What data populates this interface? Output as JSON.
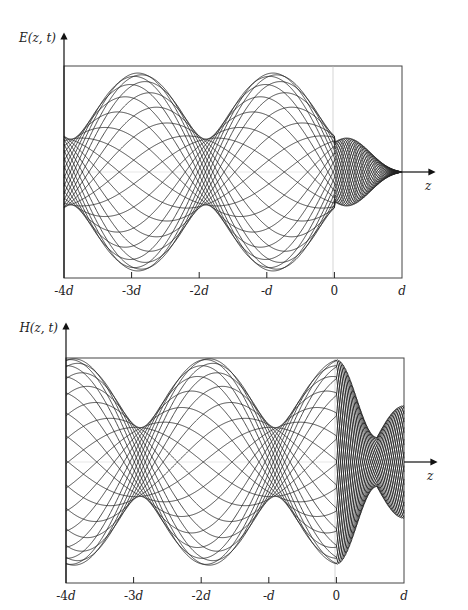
{
  "figure": {
    "panels": [
      {
        "id": "E",
        "ylabel": "E(z, t)",
        "xlabel": "z",
        "ticks": [
          "-4d",
          "-3d",
          "-2d",
          "-d",
          "0",
          "d"
        ]
      },
      {
        "id": "H",
        "ylabel": "H(z, t)",
        "xlabel": "z",
        "ticks": [
          "-4d",
          "-3d",
          "-2d",
          "-d",
          "0",
          "d"
        ]
      }
    ]
  },
  "chart_data": [
    {
      "type": "line",
      "title": "",
      "ylabel": "E(z, t)",
      "xlabel": "z",
      "x_ticks": [
        "-4d",
        "-3d",
        "-2d",
        "-d",
        "0",
        "d"
      ],
      "x_range": [
        "-4d",
        "d"
      ],
      "grid": false,
      "legend": null,
      "description": "Family of snapshots of E(z,t) for many instants t; envelope forms a partial standing wave for z<0 (max/min ratio ~3) with maxima near -3d and -d, minima near -4d, -2d and just left of 0; region 0<z<d shows a short-wavelength small-amplitude bulge converging to zero at z=d.",
      "envelope_region1": {
        "max_at": [
          "-3d",
          "-d"
        ],
        "min_at": [
          "-4d",
          "-2d",
          "~-0.1d"
        ],
        "max_over_min": 3
      },
      "envelope_region2": {
        "value_at_0": 0.45,
        "bulge_at": "0.6d",
        "value_at_d": 0
      }
    },
    {
      "type": "line",
      "title": "",
      "ylabel": "H(z, t)",
      "xlabel": "z",
      "x_ticks": [
        "-4d",
        "-3d",
        "-2d",
        "-d",
        "0",
        "d"
      ],
      "x_range": [
        "-4d",
        "d"
      ],
      "grid": false,
      "legend": null,
      "description": "Family of snapshots of H(z,t); envelope is partial standing wave for z<0 with maxima near -4d, -2d and 0 and minima near -3d and -d; region 0<z<d shows short-wavelength pattern with minimum near 0.6d and rising toward z=d.",
      "envelope_region1": {
        "max_at": [
          "-4d",
          "-2d",
          "0"
        ],
        "min_at": [
          "-3d",
          "-d"
        ],
        "max_over_min": 3
      },
      "envelope_region2": {
        "value_at_0": 1.0,
        "min_at": "0.6d",
        "value_at_d": 0.55
      }
    }
  ]
}
